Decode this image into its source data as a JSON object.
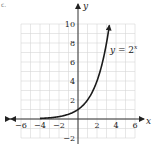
{
  "corner_mark": "c.",
  "chart_data": {
    "type": "line",
    "title": "",
    "function_label": "y = 2^x",
    "function_label_parts": {
      "lhs": "y",
      "eq": " = 2",
      "exp": "x"
    },
    "xlabel": "x",
    "ylabel": "y",
    "xlim": [
      -6,
      6
    ],
    "ylim": [
      -2,
      10
    ],
    "grid": true,
    "grid_step": 1,
    "x_ticks": [
      -6,
      -4,
      -2,
      2,
      4,
      6
    ],
    "x_tick_labels": [
      "−6",
      "−4",
      "−2",
      "2",
      "4",
      "6"
    ],
    "y_ticks": [
      -2,
      2,
      4,
      6,
      8,
      10
    ],
    "y_tick_labels": [
      "−2",
      "2",
      "4",
      "6",
      "8",
      "10"
    ],
    "series": [
      {
        "name": "y = 2^x",
        "x": [
          -4,
          -3,
          -2,
          -1,
          0,
          1,
          2,
          3,
          3.32
        ],
        "y": [
          0.0625,
          0.125,
          0.25,
          0.5,
          1,
          2,
          4,
          8,
          10
        ],
        "arrow_at_end": true,
        "arrow_at_start": false
      }
    ],
    "axes_arrows": {
      "x": "both",
      "y": "both"
    },
    "colors": {
      "curve": "#1a1a1a",
      "axis": "#333333",
      "grid": "#d6d6d6"
    }
  }
}
